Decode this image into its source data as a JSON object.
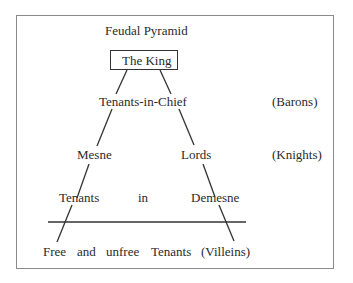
{
  "diagram": {
    "title": "Feudal Pyramid",
    "apex": "The King",
    "levels": [
      {
        "label": "Tenants-in-Chief",
        "class": "(Barons)"
      },
      {
        "left": "Mesne",
        "right": "Lords",
        "class": "(Knights)"
      },
      {
        "left": "Tenants",
        "middle": "in",
        "right": "Demesne"
      }
    ],
    "base": {
      "words": [
        "Free",
        "and",
        "unfree",
        "Tenants",
        "(Villeins)"
      ]
    },
    "colors": {
      "line": "#333333",
      "frame": "#8a8a8a",
      "text": "#2a2a2a"
    }
  }
}
